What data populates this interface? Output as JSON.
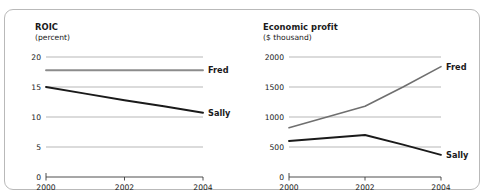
{
  "figure": {
    "background": "#ffffff",
    "border_color": "#b9b9b9"
  },
  "chart_data": [
    {
      "id": "roic",
      "type": "line",
      "title": "ROIC",
      "subtitle": "(percent)",
      "xlabel": "",
      "ylabel": "percent",
      "x": [
        2000,
        2001,
        2002,
        2003,
        2004
      ],
      "xticks": [
        "2000",
        "2002",
        "2004"
      ],
      "xtick_values": [
        2000,
        2002,
        2004
      ],
      "xlim": [
        2000,
        2004
      ],
      "yticks": [
        "20",
        "15",
        "10",
        "5",
        "0"
      ],
      "ytick_values": [
        20,
        15,
        10,
        5,
        0
      ],
      "ylim": [
        0,
        20
      ],
      "grid": "horizontal",
      "legend": "inline-right",
      "series": [
        {
          "name": "Fred",
          "color": "#8c8c8c",
          "width": 1.9,
          "values": [
            17.8,
            17.8,
            17.8,
            17.8,
            17.8
          ]
        },
        {
          "name": "Sally",
          "color": "#1a1a1a",
          "width": 1.9,
          "values": [
            15.0,
            13.9,
            12.8,
            11.8,
            10.7
          ]
        }
      ]
    },
    {
      "id": "economic-profit",
      "type": "line",
      "title": "Economic profit",
      "subtitle": "($ thousand)",
      "xlabel": "",
      "ylabel": "$ thousand",
      "x": [
        2000,
        2001,
        2002,
        2003,
        2004
      ],
      "xticks": [
        "2000",
        "2002",
        "2004"
      ],
      "xtick_values": [
        2000,
        2002,
        2004
      ],
      "xlim": [
        2000,
        2004
      ],
      "yticks": [
        "2000",
        "1500",
        "1000",
        "500",
        "0"
      ],
      "ytick_values": [
        2000,
        1500,
        1000,
        500,
        0
      ],
      "ylim": [
        0,
        2000
      ],
      "grid": "horizontal",
      "legend": "inline-right",
      "series": [
        {
          "name": "Fred",
          "color": "#6f6f6f",
          "width": 1.6,
          "values": [
            820,
            1000,
            1180,
            1500,
            1840
          ]
        },
        {
          "name": "Sally",
          "color": "#1a1a1a",
          "width": 1.9,
          "values": [
            600,
            650,
            700,
            540,
            370
          ]
        }
      ]
    }
  ]
}
